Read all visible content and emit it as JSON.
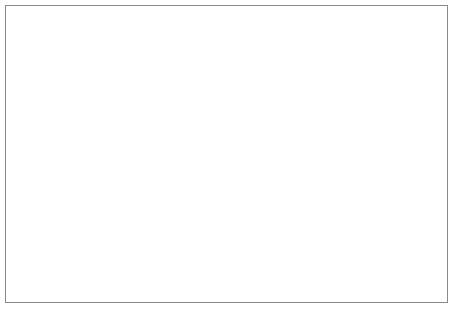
{
  "diagram": {
    "type": "tree",
    "border_color": "#8a8a8a",
    "node_border_color": "#6d6d6d",
    "edge_color": "#3a3a3a",
    "background": "#ffffff",
    "levels": 4
  },
  "nodes": {
    "root": {
      "label": "root (.)",
      "x": 198,
      "y": 18,
      "w": 60,
      "h": 21
    },
    "tld": [
      {
        "id": "com",
        "label": "com",
        "x": 18,
        "y": 123,
        "w": 33,
        "h": 17
      },
      {
        "id": "gov",
        "label": "gov",
        "x": 57,
        "y": 123,
        "w": 31,
        "h": 17
      },
      {
        "id": "edu",
        "label": "edu",
        "x": 94,
        "y": 123,
        "w": 31,
        "h": 17
      },
      {
        "id": "mil",
        "label": "mil",
        "x": 131,
        "y": 123,
        "w": 29,
        "h": 17
      },
      {
        "id": "net",
        "label": "net",
        "x": 166,
        "y": 123,
        "w": 31,
        "h": 17
      },
      {
        "id": "int",
        "label": "int",
        "x": 203,
        "y": 123,
        "w": 29,
        "h": 17
      },
      {
        "id": "org",
        "label": "org",
        "x": 236,
        "y": 123,
        "w": 31,
        "h": 17
      },
      {
        "id": "uk",
        "label": "uk",
        "x": 272,
        "y": 123,
        "w": 28,
        "h": 17
      },
      {
        "id": "us",
        "label": "us",
        "x": 306,
        "y": 123,
        "w": 28,
        "h": 17
      },
      {
        "id": "in",
        "label": "in",
        "x": 339,
        "y": 123,
        "w": 28,
        "h": 17
      },
      {
        "id": "de",
        "label": "de",
        "x": 372,
        "y": 123,
        "w": 29,
        "h": 17
      },
      {
        "id": "au",
        "label": "au",
        "x": 406,
        "y": 123,
        "w": 29,
        "h": 17
      }
    ],
    "second": [
      {
        "id": "ge",
        "label": "ge",
        "x": 18,
        "y": 195,
        "w": 24,
        "h": 17
      },
      {
        "id": "amazon",
        "label": "amazon",
        "x": 46,
        "y": 195,
        "w": 45,
        "h": 17
      },
      {
        "id": "sun",
        "label": "sun",
        "x": 85,
        "y": 195,
        "w": 30,
        "h": 17
      },
      {
        "id": "berkeley",
        "label": "berkeley",
        "x": 116,
        "y": 195,
        "w": 50,
        "h": 17
      },
      {
        "id": "internic",
        "label": "internic",
        "x": 178,
        "y": 195,
        "w": 50,
        "h": 17
      },
      {
        "id": "affinity",
        "label": "affinity",
        "x": 238,
        "y": 195,
        "w": 48,
        "h": 17
      },
      {
        "id": "linux",
        "label": "linux",
        "x": 292,
        "y": 195,
        "w": 33,
        "h": 17
      },
      {
        "id": "who",
        "label": "who",
        "x": 328,
        "y": 195,
        "w": 31,
        "h": 17
      },
      {
        "id": "net2",
        "label": "net",
        "x": 362,
        "y": 195,
        "w": 29,
        "h": 17
      },
      {
        "id": "co1",
        "label": "co",
        "x": 395,
        "y": 195,
        "w": 28,
        "h": 17
      },
      {
        "id": "co2",
        "label": "co",
        "x": 428,
        "y": 195,
        "w": 28,
        "h": 17
      }
    ],
    "third": [
      {
        "id": "cs",
        "label": "cs",
        "x": 100,
        "y": 277,
        "w": 42,
        "h": 17
      },
      {
        "id": "rs",
        "label": "rs",
        "x": 190,
        "y": 277,
        "w": 42,
        "h": 17
      },
      {
        "id": "vsnl",
        "label": "vsnl",
        "x": 302,
        "y": 277,
        "w": 35,
        "h": 17
      },
      {
        "id": "nic",
        "label": "nic",
        "x": 355,
        "y": 277,
        "w": 33,
        "h": 17
      }
    ]
  },
  "edges": {
    "root_fan_origin": {
      "x": 228,
      "y": 48
    },
    "root_to_tld": [
      "com",
      "gov",
      "edu",
      "mil",
      "net",
      "int",
      "org",
      "uk",
      "us",
      "in",
      "de",
      "au"
    ],
    "tld_to_second": [
      {
        "from": "com",
        "to": "ge"
      },
      {
        "from": "com",
        "to": "amazon"
      },
      {
        "from": "com",
        "to": "sun"
      },
      {
        "from": "edu",
        "to": "berkeley"
      },
      {
        "from": "net",
        "to": "internic"
      },
      {
        "from": "net",
        "to": "affinity"
      },
      {
        "from": "org",
        "to": "linux"
      },
      {
        "from": "org",
        "to": "who"
      },
      {
        "from": "in",
        "to": "net2"
      },
      {
        "from": "in",
        "to": "co1"
      },
      {
        "from": "de",
        "to": "co2"
      }
    ],
    "second_to_third": [
      {
        "from": "berkeley",
        "to": "cs"
      },
      {
        "from": "internic",
        "to": "rs"
      },
      {
        "from": "net2",
        "to": "vsnl"
      },
      {
        "from": "net2",
        "to": "nic"
      }
    ]
  }
}
